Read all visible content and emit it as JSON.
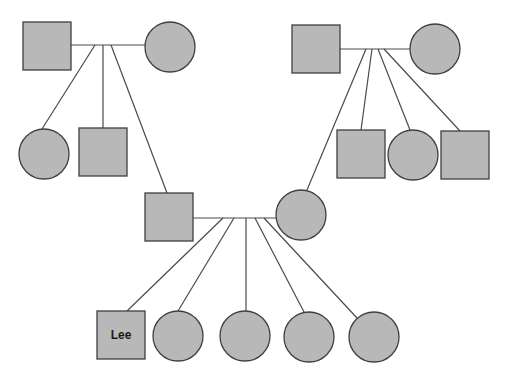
{
  "diagram": {
    "type": "pedigree",
    "colors": {
      "fill": "#b8b8b8",
      "stroke": "#3f3f3f",
      "line": "#4a4a4a",
      "background": "#ffffff"
    },
    "generation1": {
      "left_couple": {
        "male": {
          "shape": "square",
          "x": 23,
          "y": 22,
          "size": 48
        },
        "female": {
          "shape": "circle",
          "cx": 170,
          "cy": 47,
          "r": 25
        },
        "mating_line": {
          "x1": 71,
          "x2": 145,
          "y": 45
        }
      },
      "right_couple": {
        "male": {
          "shape": "square",
          "x": 292,
          "y": 25,
          "size": 48
        },
        "female": {
          "shape": "circle",
          "cx": 435,
          "cy": 49,
          "r": 25
        },
        "mating_line": {
          "x1": 340,
          "x2": 410,
          "y": 49
        }
      }
    },
    "generation2": {
      "left_siblings": [
        {
          "shape": "circle",
          "cx": 44,
          "cy": 154,
          "r": 25
        },
        {
          "shape": "square",
          "x": 79,
          "y": 128,
          "size": 48
        }
      ],
      "right_siblings": [
        {
          "shape": "square",
          "x": 337,
          "y": 130,
          "size": 48
        },
        {
          "shape": "circle",
          "cx": 413,
          "cy": 155,
          "r": 25
        },
        {
          "shape": "square",
          "x": 441,
          "y": 131,
          "size": 48
        }
      ],
      "middle_couple": {
        "male": {
          "shape": "square",
          "x": 145,
          "y": 193,
          "size": 48
        },
        "female": {
          "shape": "circle",
          "cx": 301,
          "cy": 215,
          "r": 25
        },
        "mating_line": {
          "x1": 193,
          "x2": 276,
          "y": 218
        }
      }
    },
    "generation3": {
      "children": [
        {
          "shape": "square",
          "x": 97,
          "y": 311,
          "size": 48,
          "label": "Lee"
        },
        {
          "shape": "circle",
          "cx": 178,
          "cy": 336,
          "r": 25
        },
        {
          "shape": "circle",
          "cx": 245,
          "cy": 336,
          "r": 25
        },
        {
          "shape": "circle",
          "cx": 309,
          "cy": 337,
          "r": 25
        },
        {
          "shape": "circle",
          "cx": 374,
          "cy": 337,
          "r": 25
        }
      ]
    },
    "proband_label": "Lee"
  }
}
